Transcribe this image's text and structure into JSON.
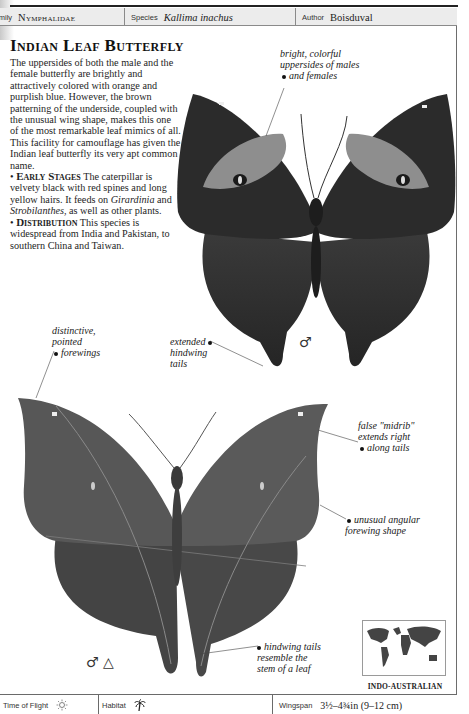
{
  "header": {
    "family_label": "Family",
    "family_value": "Nymphalidae",
    "species_label": "Species",
    "species_value": "Kallima inachus",
    "author_label": "Author",
    "author_value": "Boisduval"
  },
  "title": "Indian Leaf Butterfly",
  "body": {
    "intro": "The uppersides of both the male and the female butterfly are brightly and attractively colored with orange and purplish blue. However, the brown patterning of the underside, coupled with the unusual wing shape, makes this one of the most remarkable leaf mimics of all. This facility for camouflage has given the Indian leaf butterfly its very apt common name.",
    "early_stages_heading": "Early Stages",
    "early_stages_text_1": "The caterpillar is velvety black with red spines and long yellow hairs. It feeds on ",
    "early_stages_plant_1": "Girardinia",
    "early_stages_and": " and ",
    "early_stages_plant_2": "Strobilanthes",
    "early_stages_text_2": ", as well as other plants.",
    "distribution_heading": "Distribution",
    "distribution_text": "This species is widespread from India and Pakistan, to southern China and Taiwan."
  },
  "annotations": {
    "upperside": [
      "bright, colorful",
      "uppersides of males",
      "and females"
    ],
    "forewings": [
      "distinctive,",
      "pointed",
      "forewings"
    ],
    "tails": [
      "extended",
      "hindwing",
      "tails"
    ],
    "midrib": [
      "false \"midrib\"",
      "extends right",
      "along tails"
    ],
    "angular": [
      "unusual angular",
      "forewing shape"
    ],
    "stem": [
      "hindwing tails",
      "resemble the",
      "stem of a leaf"
    ]
  },
  "symbols": {
    "upper_sex": "♂",
    "lower_sex": "♂ △"
  },
  "map": {
    "region_label": "INDO-AUSTRALIAN"
  },
  "footer": {
    "time_of_flight_label": "Time of Flight",
    "time_of_flight_icon": "sun-icon (day flying)",
    "habitat_label": "Habitat",
    "habitat_icon": "palm-tree-icon (tropical forest)",
    "wingspan_label": "Wingspan",
    "wingspan_value": "3½–4¾in (9–12 cm)"
  },
  "colors": {
    "header_bg": "#ececec",
    "rule": "#222222",
    "wing_dark": "#2a2a2a",
    "wing_band": "#8c8c8c",
    "underside": "#555555"
  }
}
